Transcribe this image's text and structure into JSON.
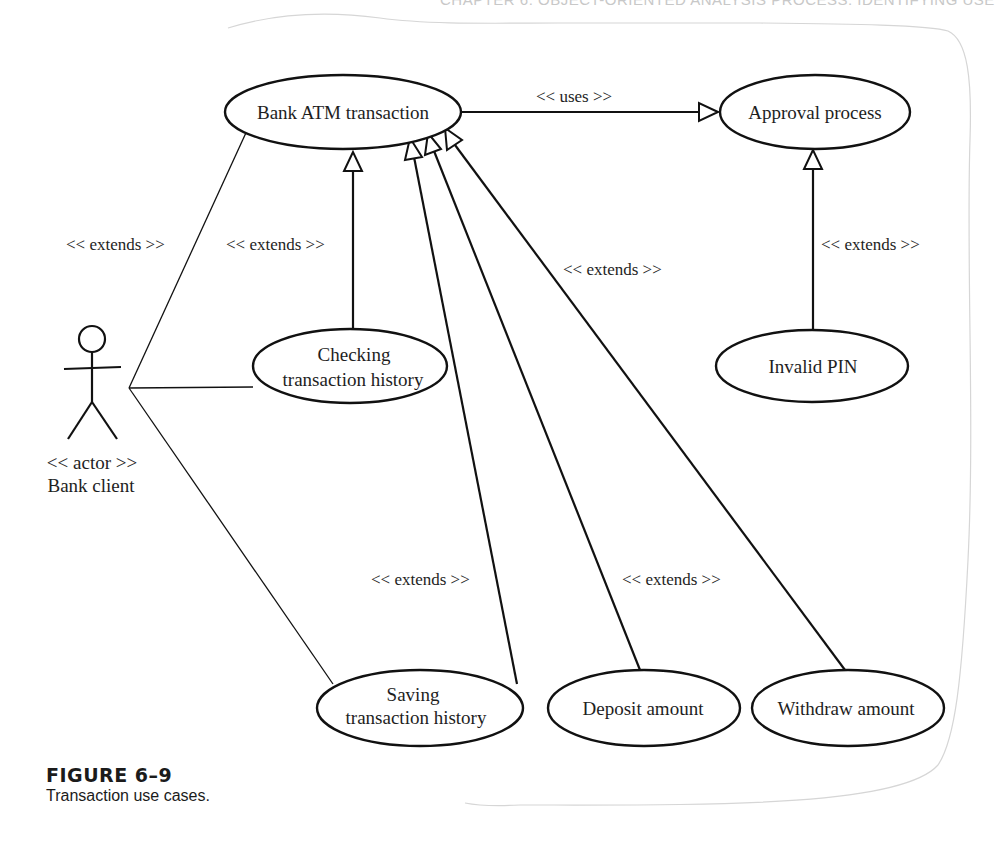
{
  "running_head": "CHAPTER 6: OBJECT-ORIENTED ANALYSIS PROCESS: IDENTIFYING USE",
  "colors": {
    "stroke": "#111111",
    "text": "#1e1e1e",
    "frame": "#c8c8c8",
    "background": "#ffffff"
  },
  "actor": {
    "name": "Bank client",
    "stereotype": "<< actor >>",
    "icon": "stick-figure-icon"
  },
  "use_cases": [
    {
      "id": "bank_atm",
      "lines": [
        "Bank ATM transaction"
      ],
      "cx": 343,
      "cy": 112,
      "rx": 118,
      "ry": 37
    },
    {
      "id": "approval",
      "lines": [
        "Approval process"
      ],
      "cx": 815,
      "cy": 112,
      "rx": 95,
      "ry": 37
    },
    {
      "id": "checking",
      "lines": [
        "Checking",
        "transaction history"
      ],
      "cx": 350,
      "cy": 366,
      "rx": 97,
      "ry": 37
    },
    {
      "id": "invalid_pin",
      "lines": [
        "Invalid PIN"
      ],
      "cx": 812,
      "cy": 366,
      "rx": 96,
      "ry": 36
    },
    {
      "id": "saving",
      "lines": [
        "Saving",
        "transaction history"
      ],
      "cx": 420,
      "cy": 708,
      "rx": 103,
      "ry": 38
    },
    {
      "id": "deposit",
      "lines": [
        "Deposit amount"
      ],
      "cx": 644,
      "cy": 708,
      "rx": 96,
      "ry": 38
    },
    {
      "id": "withdraw",
      "lines": [
        "Withdraw amount"
      ],
      "cx": 848,
      "cy": 708,
      "rx": 96,
      "ry": 38
    }
  ],
  "relationships": [
    {
      "type": "association",
      "from": "actor",
      "to": "bank_atm",
      "label": "<< extends >>"
    },
    {
      "type": "association",
      "from": "actor",
      "to": "checking",
      "label": ""
    },
    {
      "type": "association",
      "from": "actor",
      "to": "saving",
      "label": ""
    },
    {
      "type": "uses",
      "from": "bank_atm",
      "to": "approval",
      "label": "<< uses >>"
    },
    {
      "type": "extends",
      "from": "checking",
      "to": "bank_atm",
      "label": "<< extends >>"
    },
    {
      "type": "extends",
      "from": "saving",
      "to": "bank_atm",
      "label": "<< extends >>"
    },
    {
      "type": "extends",
      "from": "deposit",
      "to": "bank_atm",
      "label": "<< extends >>"
    },
    {
      "type": "extends",
      "from": "withdraw",
      "to": "bank_atm",
      "label": "<< extends >>"
    },
    {
      "type": "extends",
      "from": "invalid_pin",
      "to": "approval",
      "label": "<< extends >>"
    }
  ],
  "labels": {
    "actor_link": "<< extends >>",
    "checking_link": "<< extends >>",
    "uses_link": "<< uses >>",
    "withdraw_link": "<< extends >>",
    "invalid_pin_link": "<< extends >>",
    "saving_link": "<< extends >>",
    "deposit_link": "<< extends >>"
  },
  "caption": {
    "figure_number": "FIGURE 6–9",
    "description": "Transaction use cases."
  }
}
